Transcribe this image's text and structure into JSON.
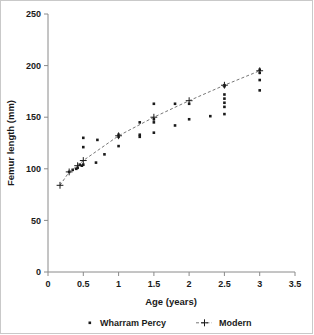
{
  "chart_data": {
    "type": "scatter",
    "title": "",
    "xlabel": "Age (years)",
    "ylabel": "Femur length (mm)",
    "xlim": [
      0,
      3.5
    ],
    "ylim": [
      0,
      250
    ],
    "xticks": [
      "0",
      "0.5",
      "1",
      "1.5",
      "2",
      "2.5",
      "3",
      "3.5"
    ],
    "xtick_values": [
      0,
      0.5,
      1,
      1.5,
      2,
      2.5,
      3,
      3.5
    ],
    "yticks": [
      "0",
      "50",
      "100",
      "150",
      "200",
      "250"
    ],
    "ytick_values": [
      0,
      50,
      100,
      150,
      200,
      250
    ],
    "grid": false,
    "legend_position": "bottom",
    "series": [
      {
        "name": "Wharram Percy",
        "marker": "small-filled-square",
        "color": "#1a1a1a",
        "line": "none",
        "points": [
          [
            0.3,
            97
          ],
          [
            0.35,
            99
          ],
          [
            0.4,
            100
          ],
          [
            0.42,
            101
          ],
          [
            0.45,
            104
          ],
          [
            0.48,
            103
          ],
          [
            0.5,
            130
          ],
          [
            0.5,
            121
          ],
          [
            0.5,
            104
          ],
          [
            0.68,
            106
          ],
          [
            0.7,
            128
          ],
          [
            0.8,
            114
          ],
          [
            1.0,
            133
          ],
          [
            1.0,
            131
          ],
          [
            1.0,
            122
          ],
          [
            1.3,
            145
          ],
          [
            1.3,
            133
          ],
          [
            1.3,
            131
          ],
          [
            1.5,
            163
          ],
          [
            1.5,
            148
          ],
          [
            1.5,
            145
          ],
          [
            1.5,
            135
          ],
          [
            1.8,
            163
          ],
          [
            1.8,
            142
          ],
          [
            2.0,
            163
          ],
          [
            2.0,
            148
          ],
          [
            2.3,
            151
          ],
          [
            2.5,
            181
          ],
          [
            2.5,
            180
          ],
          [
            2.5,
            172
          ],
          [
            2.5,
            168
          ],
          [
            2.5,
            164
          ],
          [
            2.5,
            160
          ],
          [
            2.5,
            153
          ],
          [
            3.0,
            196
          ],
          [
            3.0,
            193
          ],
          [
            3.0,
            186
          ],
          [
            3.0,
            176
          ]
        ]
      },
      {
        "name": "Modern",
        "marker": "plus",
        "color": "#1a1a1a",
        "line": "dashed",
        "line_color": "#777777",
        "points": [
          [
            0.17,
            84
          ],
          [
            0.3,
            97
          ],
          [
            0.42,
            103
          ],
          [
            0.5,
            108
          ],
          [
            1.0,
            132
          ],
          [
            1.5,
            150
          ],
          [
            2.0,
            166
          ],
          [
            2.5,
            181
          ],
          [
            3.0,
            195
          ]
        ]
      }
    ]
  },
  "legend": {
    "items": [
      {
        "label": "Wharram Percy",
        "marker": "dot"
      },
      {
        "label": "Modern",
        "marker": "dashed-plus"
      }
    ]
  }
}
